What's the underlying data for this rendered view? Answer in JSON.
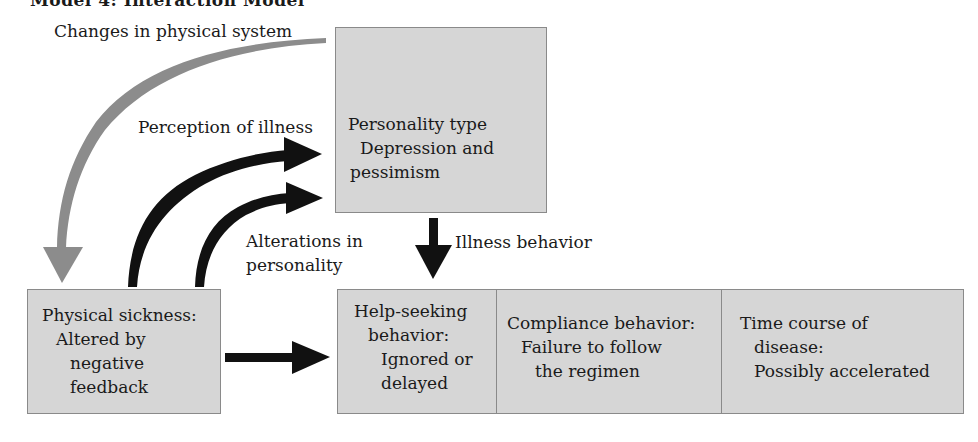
{
  "title": "Model 4: Interaction Model",
  "colors": {
    "box_fill": "#d6d6d6",
    "box_border": "#8a8a8a",
    "arrow_black": "#111111",
    "arrow_grey": "#8c8c8c"
  },
  "labels": {
    "changes": "Changes in physical system",
    "perception": "Perception of illness",
    "alterations_line1": "Alterations in",
    "alterations_line2": "personality",
    "illness_behavior": "Illness behavior"
  },
  "boxes": {
    "personality": {
      "line1": "Personality type",
      "line2": "Depression and",
      "line3": "pessimism"
    },
    "physical": {
      "line1": "Physical sickness:",
      "line2": "Altered by",
      "line3": "negative",
      "line4": "feedback"
    },
    "outcomes": [
      {
        "line1": "Help-seeking",
        "line2": "behavior:",
        "line3": "Ignored or",
        "line4": "delayed"
      },
      {
        "line1": "Compliance behavior:",
        "line2": "Failure to follow",
        "line3": "the regimen"
      },
      {
        "line1": "Time course of",
        "line2": "disease:",
        "line3": "Possibly accelerated"
      }
    ]
  },
  "arrows": [
    {
      "from": "personality",
      "to": "physical",
      "label": "Changes in physical system",
      "color": "grey"
    },
    {
      "from": "physical",
      "to": "personality",
      "label": "Perception of illness",
      "color": "black"
    },
    {
      "from": "physical",
      "to": "personality",
      "label": "Alterations in personality",
      "color": "black"
    },
    {
      "from": "personality",
      "to": "outcomes",
      "label": "Illness behavior",
      "color": "black"
    },
    {
      "from": "physical",
      "to": "outcomes",
      "label": "",
      "color": "black"
    }
  ]
}
